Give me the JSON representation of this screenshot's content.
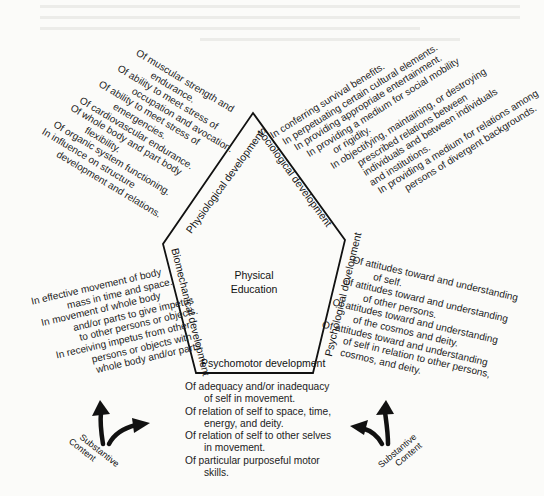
{
  "diagram": {
    "center": {
      "line1": "Physical",
      "line2": "Education"
    },
    "sides": {
      "physiological": "Physiological development",
      "sociological": "Sociological development",
      "psychological": "Psychological development",
      "psychomotor": "Psychomotor development",
      "biomechanical": "Biomechanical development"
    },
    "physiological_items": [
      [
        "Of muscular strength and",
        "endurance."
      ],
      [
        "Of ability to meet stress of",
        "occupation and avocation."
      ],
      [
        "Of ability to meet stress of",
        "emergencies."
      ],
      [
        "Of cardiovascular endurance."
      ],
      [
        "Of whole body and part body",
        "flexibility."
      ],
      [
        "Of organic system functioning."
      ],
      [
        "In influence on structure",
        "development and relations."
      ]
    ],
    "sociological_items": [
      [
        "In conferring survival benefits."
      ],
      [
        "In perpetuating certain cultural elements."
      ],
      [
        "In providing appropriate entertainment."
      ],
      [
        "In providing a medium for social mobility",
        "or rigidity."
      ],
      [
        "In objectifying, maintaining, or destroying",
        "prescribed relations between",
        "individuals and between individuals",
        "and institutions."
      ],
      [
        "In providing a medium for relations among",
        "persons of divergent backgrounds."
      ]
    ],
    "psychological_items": [
      [
        "Of attitudes toward and understanding",
        "of self."
      ],
      [
        "Of attitudes toward and understanding",
        "of other persons."
      ],
      [
        "Of attitudes toward and understanding",
        "of the cosmos and deity."
      ],
      [
        "Of attitudes toward and understanding",
        "of self in relation to other persons,",
        "cosmos, and deity."
      ]
    ],
    "biomechanical_items": [
      [
        "In effective movement of body",
        "mass in time and space."
      ],
      [
        "In movement of whole body",
        "and/or parts to give impetus",
        "to other persons or objects."
      ],
      [
        "In receiving impetus from other",
        "persons or objects with",
        "whole body and/or parts."
      ]
    ],
    "psychomotor_items": [
      [
        "Of adequacy and/or inadequacy",
        "of self in movement."
      ],
      [
        "Of relation of self to space, time,",
        "energy, and deity."
      ],
      [
        "Of relation of self to other selves",
        "in movement."
      ],
      [
        "Of particular purposeful motor",
        "skills."
      ]
    ],
    "substantive_content_left": {
      "line1": "Substantive",
      "line2": "Content",
      "icon": "forking-arrows-icon"
    },
    "substantive_content_right": {
      "line1": "Substantive",
      "line2": "Content",
      "icon": "forking-arrows-icon"
    }
  }
}
